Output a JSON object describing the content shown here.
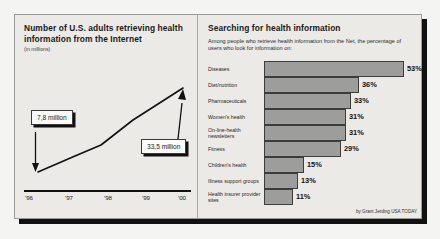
{
  "left_panel": {
    "title": "Number of U.S. adults retrieving health information from the Internet",
    "subtitle": "(in millions)",
    "callout_start": "7,8 million",
    "callout_end": "33,5 million"
  },
  "right_panel": {
    "title": "Searching for health information",
    "lede": "Among people who retrieve health information from the Net, the percentage of users who look for information on:",
    "credit": "by Grant Jerding USA TODAY"
  },
  "colors": {
    "bar_fill": "#9d9d9b",
    "bar_border": "#3c3c3a",
    "panel_bg": "#eceae6",
    "frame_border": "#9a9a96",
    "shadow": "#111111"
  },
  "chart_data": [
    {
      "type": "line",
      "title": "Number of U.S. adults retrieving health information from the Internet",
      "subtitle": "(in millions)",
      "xlabel": "",
      "ylabel": "",
      "x": [
        "'96",
        "'97",
        "'98",
        "'99",
        "'00"
      ],
      "categories": [
        "'96",
        "'97",
        "'98",
        "'99",
        "'00"
      ],
      "values": [
        7.8,
        13.5,
        19.0,
        26.5,
        33.5
      ],
      "ylim": [
        0,
        36
      ],
      "grid": false,
      "legend": "none",
      "annotations": [
        {
          "text": "7,8 million",
          "point": "'96",
          "value": 7.8
        },
        {
          "text": "33,5 million",
          "point": "'00",
          "value": 33.5
        }
      ]
    },
    {
      "type": "bar",
      "orientation": "horizontal",
      "title": "Searching for health information",
      "subtitle": "Among people who retrieve health information from the Net, the percentage of users who look for information on:",
      "xlabel": "",
      "ylabel": "",
      "categories": [
        "Diseases",
        "Diet/nutrition",
        "Pharmaceuticals",
        "Women's health",
        "On-line-health newsletters",
        "Fitness",
        "Children's health",
        "Illness support groups",
        "Health insurer provider sites"
      ],
      "values": [
        53,
        36,
        33,
        31,
        31,
        29,
        15,
        13,
        11
      ],
      "value_labels": [
        "53%",
        "36%",
        "33%",
        "31%",
        "31%",
        "29%",
        "15%",
        "13%",
        "11%"
      ],
      "xlim": [
        0,
        53
      ],
      "grid": false,
      "legend": "none"
    }
  ],
  "axis_ticks": [
    "'96",
    "'97",
    "'98",
    "'99",
    "'00"
  ]
}
